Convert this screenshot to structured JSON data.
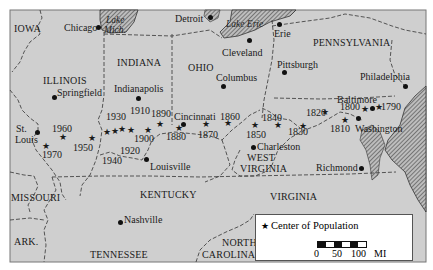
{
  "colors": {
    "land": "#cfcfcf",
    "frame": "#666666",
    "water_hatch": "#555555",
    "text": "#1a1a1a"
  },
  "states": [
    {
      "name": "IOWA",
      "x": 14,
      "y": 24
    },
    {
      "name": "ILLINOIS",
      "x": 43,
      "y": 76
    },
    {
      "name": "INDIANA",
      "x": 117,
      "y": 58
    },
    {
      "name": "OHIO",
      "x": 188,
      "y": 63
    },
    {
      "name": "PENNSYLVANIA",
      "x": 313,
      "y": 38
    },
    {
      "name": "MISSOURI",
      "x": 11,
      "y": 193
    },
    {
      "name": "KENTUCKY",
      "x": 140,
      "y": 190
    },
    {
      "name": "WEST",
      "x": 247,
      "y": 153
    },
    {
      "name": "VIRGINIA",
      "x": 240,
      "y": 164
    },
    {
      "name": "VIRGINIA",
      "x": 270,
      "y": 192
    },
    {
      "name": "ARK.",
      "x": 14,
      "y": 237
    },
    {
      "name": "TENNESSEE",
      "x": 90,
      "y": 250
    },
    {
      "name": "NORTH",
      "x": 222,
      "y": 238
    },
    {
      "name": "CAROLINA",
      "x": 202,
      "y": 250
    }
  ],
  "lakes": [
    {
      "name": "Lake",
      "x": 106,
      "y": 16
    },
    {
      "name": "Mich.",
      "x": 104,
      "y": 26
    },
    {
      "name": "Lake Erie",
      "x": 226,
      "y": 20
    }
  ],
  "cities": [
    {
      "name": "Chicago",
      "label_x": 64,
      "label_y": 23,
      "dot_x": 98,
      "dot_y": 27
    },
    {
      "name": "Detroit",
      "label_x": 175,
      "label_y": 14,
      "dot_x": 210,
      "dot_y": 17
    },
    {
      "name": "Erie",
      "label_x": 274,
      "label_y": 29,
      "dot_x": 279,
      "dot_y": 24
    },
    {
      "name": "Cleveland",
      "label_x": 222,
      "label_y": 48,
      "dot_x": 249,
      "dot_y": 40
    },
    {
      "name": "Columbus",
      "label_x": 216,
      "label_y": 73,
      "dot_x": 223,
      "dot_y": 86
    },
    {
      "name": "Pittsburgh",
      "label_x": 277,
      "label_y": 60,
      "dot_x": 284,
      "dot_y": 72
    },
    {
      "name": "Philadelphia",
      "label_x": 360,
      "label_y": 72,
      "dot_x": 405,
      "dot_y": 86
    },
    {
      "name": "Springfield",
      "label_x": 57,
      "label_y": 88,
      "dot_x": 54,
      "dot_y": 97
    },
    {
      "name": "Indianapolis",
      "label_x": 114,
      "label_y": 84,
      "dot_x": 138,
      "dot_y": 98
    },
    {
      "name": "Cincinnati",
      "label_x": 174,
      "label_y": 112,
      "dot_x": 183,
      "dot_y": 124
    },
    {
      "name": "St.",
      "label_x": 16,
      "label_y": 124,
      "dot_x": 37,
      "dot_y": 132
    },
    {
      "name": "Louis",
      "label_x": 15,
      "label_y": 135,
      "dot_x": null,
      "dot_y": null
    },
    {
      "name": "Louisville",
      "label_x": 150,
      "label_y": 162,
      "dot_x": 146,
      "dot_y": 159
    },
    {
      "name": "Baltimore",
      "label_x": 337,
      "label_y": 95,
      "dot_x": 372,
      "dot_y": 108
    },
    {
      "name": "Washington",
      "label_x": 355,
      "label_y": 124,
      "dot_x": 358,
      "dot_y": 118
    },
    {
      "name": "Charleston",
      "label_x": 257,
      "label_y": 142,
      "dot_x": 253,
      "dot_y": 147
    },
    {
      "name": "Richmond",
      "label_x": 316,
      "label_y": 163,
      "dot_x": 361,
      "dot_y": 168
    },
    {
      "name": "Nashville",
      "label_x": 124,
      "label_y": 215,
      "dot_x": 120,
      "dot_y": 222
    }
  ],
  "population_centers": [
    {
      "year": "1790",
      "star_x": 379,
      "star_y": 108,
      "label_x": 381,
      "label_y": 102
    },
    {
      "name_hint": "",
      "year": "1800",
      "star_x": 365,
      "star_y": 110,
      "label_x": 340,
      "label_y": 102
    },
    {
      "year": "1810",
      "star_x": 345,
      "star_y": 121,
      "label_x": 330,
      "label_y": 124
    },
    {
      "year": "1820",
      "star_x": 325,
      "star_y": 113,
      "label_x": 306,
      "label_y": 108
    },
    {
      "year": "1830",
      "star_x": 303,
      "star_y": 127,
      "label_x": 288,
      "label_y": 127
    },
    {
      "year": "1840",
      "star_x": 278,
      "star_y": 126,
      "label_x": 262,
      "label_y": 113
    },
    {
      "year": "1850",
      "star_x": 255,
      "star_y": 126,
      "label_x": 246,
      "label_y": 130
    },
    {
      "year": "1860",
      "star_x": 228,
      "star_y": 124,
      "label_x": 220,
      "label_y": 112
    },
    {
      "year": "1870",
      "star_x": 206,
      "star_y": 125,
      "label_x": 198,
      "label_y": 130
    },
    {
      "year": "1880",
      "star_x": 179,
      "star_y": 129,
      "label_x": 166,
      "label_y": 132
    },
    {
      "year": "1890",
      "star_x": 160,
      "star_y": 125,
      "label_x": 151,
      "label_y": 109
    },
    {
      "year": "1900",
      "star_x": 148,
      "star_y": 131,
      "label_x": 134,
      "label_y": 134
    },
    {
      "year": "1910",
      "star_x": 131,
      "star_y": 131,
      "label_x": 130,
      "label_y": 106
    },
    {
      "year": "1920",
      "star_x": 122,
      "star_y": 130,
      "label_x": 120,
      "label_y": 146
    },
    {
      "year": "1930",
      "star_x": 115,
      "star_y": 132,
      "label_x": 106,
      "label_y": 112
    },
    {
      "year": "1940",
      "star_x": 107,
      "star_y": 133,
      "label_x": 102,
      "label_y": 156
    },
    {
      "year": "1950",
      "star_x": 92,
      "star_y": 139,
      "label_x": 73,
      "label_y": 143
    },
    {
      "year": "1960",
      "star_x": 63,
      "star_y": 138,
      "label_x": 52,
      "label_y": 124
    },
    {
      "year": "1970",
      "star_x": 46,
      "star_y": 147,
      "label_x": 42,
      "label_y": 150
    }
  ],
  "legend": {
    "symbol": "★",
    "label": "Center of Population",
    "scale_ticks": [
      {
        "label": "0",
        "x": 62
      },
      {
        "label": "50",
        "x": 80
      },
      {
        "label": "100",
        "x": 99
      },
      {
        "label": "MI",
        "x": 122
      }
    ]
  }
}
